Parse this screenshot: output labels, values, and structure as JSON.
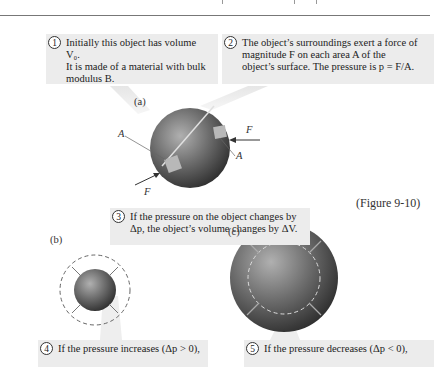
{
  "figure_label": "(Figure 9-10)",
  "panels": {
    "a": "(a)",
    "b": "(b)",
    "c": "(c)"
  },
  "callouts": [
    {
      "num": "1",
      "lines": [
        "Initially this object has volume V₀.",
        "It is made of a material with bulk",
        "modulus B."
      ]
    },
    {
      "num": "2",
      "lines": [
        "The object’s surroundings exert a force of",
        "magnitude F on each area A of the",
        "object’s surface. The pressure is p = F/A."
      ]
    },
    {
      "num": "3",
      "lines": [
        "If the pressure on the object changes by",
        "Δp, the object’s volume changes by ΔV."
      ]
    },
    {
      "num": "4",
      "lines": [
        "If the pressure increases (Δp > 0),"
      ]
    },
    {
      "num": "5",
      "lines": [
        "If the pressure decreases (Δp < 0),"
      ]
    }
  ],
  "diagram_labels": {
    "force_label": "F",
    "area_label": "A"
  },
  "colors": {
    "callout_bg": "#ececec",
    "sphere_dark": "#3a3a3a",
    "sphere_light": "#a8a8a8",
    "patch": "#b8b8b8"
  }
}
